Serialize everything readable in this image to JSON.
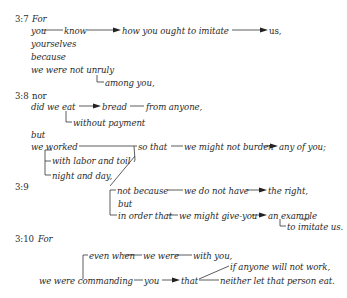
{
  "verses": {
    "v7": {
      "ref": "3:7",
      "conj": "For",
      "subject": "you",
      "verb": "know",
      "object_clause": "how you ought to imitate",
      "object": "us,",
      "intensive": "yourselves",
      "because": "because",
      "reason": "we were not unruly",
      "among": "among you,"
    },
    "v8": {
      "ref": "3:8",
      "conj": "nor",
      "clause1_verb": "did we eat",
      "clause1_object": "bread",
      "clause1_source": "from anyone,",
      "clause1_manner": "without payment",
      "but": "but",
      "clause2_verb": "we worked",
      "manner1": "with labor and toil",
      "manner2": "night and day,",
      "purpose_conj": "so that",
      "purpose_verb": "we might not burden",
      "purpose_object": "any of you;"
    },
    "v9": {
      "ref": "3:9",
      "not_because": "not because",
      "nb_verb": "we do not have",
      "nb_object": "the right,",
      "but": "but",
      "in_order_that": "in order that",
      "iot_verb": "we might give-you",
      "iot_object": "an example",
      "iot_modifier": "to imitate us."
    },
    "v10": {
      "ref": "3:10",
      "conj": "For",
      "even_when": "even when",
      "ew_subject": "we were",
      "ew_complement": "with you,",
      "main_verb": "we were commanding",
      "indirect_object": "you",
      "that": "that",
      "condition": "if anyone will not work,",
      "command": "neither let that person eat."
    }
  }
}
